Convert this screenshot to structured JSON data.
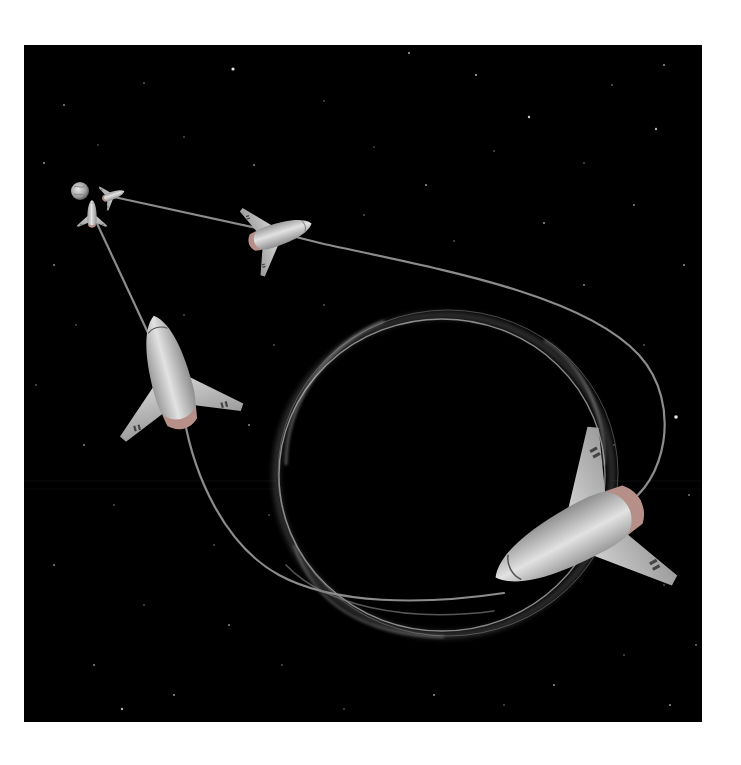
{
  "image": {
    "caption": "Spacecraft trajectory looping around a black hole / wormhole, departing from Earth",
    "background_color": "#000000",
    "page_background": "#ffffff",
    "ring_color": "#9a9a9a",
    "path_color": "#8c8c8c",
    "craft_color": "#c8c8c8"
  },
  "elements": {
    "earth": {
      "label": "Earth",
      "cx": 56,
      "cy": 146,
      "r": 9
    },
    "black_hole": {
      "label": "Black hole / wormhole lensing ring",
      "cx": 420,
      "cy": 440,
      "rx": 170,
      "ry": 160
    },
    "spacecraft": [
      {
        "label": "Spacecraft departing Earth (upper)",
        "x": 113,
        "y": 196,
        "scale": 0.35,
        "angle": 15
      },
      {
        "label": "Spacecraft departing Earth (lower)",
        "x": 92,
        "y": 214,
        "scale": 0.4,
        "angle": 0
      },
      {
        "label": "Spacecraft in transit (upper path)",
        "x": 280,
        "y": 232,
        "scale": 0.8,
        "angle": 20
      },
      {
        "label": "Spacecraft in transit (left path)",
        "x": 160,
        "y": 370,
        "scale": 1.05,
        "angle": 0
      },
      {
        "label": "Spacecraft exiting loop (foreground)",
        "x": 580,
        "y": 530,
        "scale": 1.5,
        "angle": -30
      }
    ],
    "trajectories": [
      {
        "label": "Upper trajectory from Earth to loop"
      },
      {
        "label": "Left trajectory from Earth to loop"
      }
    ]
  }
}
